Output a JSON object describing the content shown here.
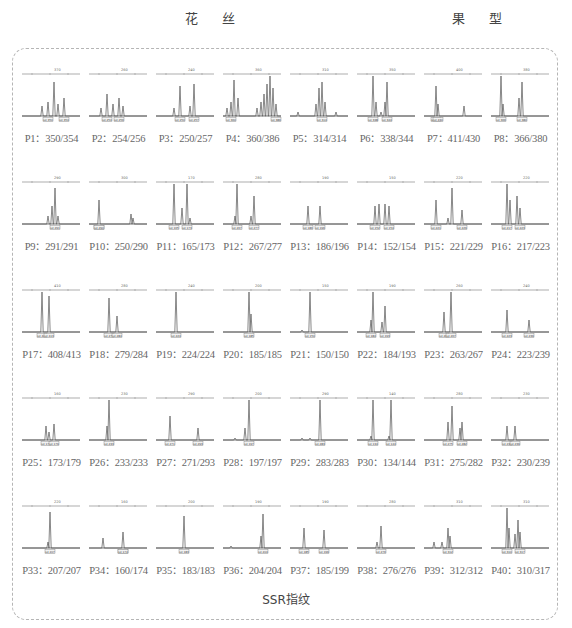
{
  "header": {
    "left_label": "花 丝",
    "right_label": "果 型"
  },
  "caption": "SSR指纹",
  "samples": [
    {
      "id": "P1",
      "label": "P1：350/354",
      "allele1": 350,
      "allele2": 354,
      "axis_tick": "370",
      "peaks": [
        [
          22,
          0.25
        ],
        [
          28,
          0.35
        ],
        [
          34,
          0.85
        ],
        [
          38,
          0.3
        ],
        [
          44,
          0.45
        ]
      ]
    },
    {
      "id": "P2",
      "label": "P2：254/256",
      "allele1": 254,
      "allele2": 256,
      "axis_tick": "260",
      "peaks": [
        [
          14,
          0.2
        ],
        [
          20,
          0.55
        ],
        [
          26,
          0.3
        ],
        [
          32,
          0.45
        ],
        [
          36,
          0.25
        ]
      ]
    },
    {
      "id": "P3",
      "label": "P3：250/257",
      "allele1": 250,
      "allele2": 257,
      "axis_tick": "240",
      "peaks": [
        [
          20,
          0.2
        ],
        [
          26,
          0.75
        ],
        [
          36,
          0.25
        ],
        [
          40,
          0.8
        ]
      ]
    },
    {
      "id": "P4",
      "label": "P4：360/386",
      "allele1": 360,
      "allele2": 386,
      "axis_tick": "360",
      "peaks": [
        [
          6,
          0.2
        ],
        [
          10,
          0.35
        ],
        [
          13,
          0.9
        ],
        [
          17,
          0.45
        ],
        [
          36,
          0.2
        ],
        [
          40,
          0.35
        ],
        [
          43,
          0.55
        ],
        [
          46,
          0.8
        ],
        [
          49,
          1.0
        ],
        [
          52,
          0.7
        ],
        [
          55,
          0.3
        ]
      ]
    },
    {
      "id": "P5",
      "label": "P5：314/314",
      "allele1": 314,
      "allele2": 314,
      "axis_tick": "310",
      "peaks": [
        [
          10,
          0.1
        ],
        [
          28,
          0.3
        ],
        [
          31,
          0.7
        ],
        [
          34,
          0.85
        ],
        [
          37,
          0.35
        ],
        [
          48,
          0.1
        ]
      ]
    },
    {
      "id": "P6",
      "label": "P6：338/344",
      "allele1": 338,
      "allele2": 344,
      "axis_tick": "350",
      "peaks": [
        [
          18,
          1.0
        ],
        [
          21,
          0.35
        ],
        [
          26,
          0.1
        ],
        [
          30,
          0.35
        ],
        [
          32,
          0.85
        ]
      ]
    },
    {
      "id": "P7",
      "label": "P7：411/430",
      "allele1": 411,
      "allele2": 430,
      "axis_tick": "400",
      "peaks": [
        [
          14,
          0.75
        ],
        [
          16,
          0.3
        ],
        [
          42,
          0.25
        ]
      ]
    },
    {
      "id": "P8",
      "label": "P8：366/380",
      "allele1": 366,
      "allele2": 380,
      "axis_tick": "380",
      "peaks": [
        [
          12,
          1.0
        ],
        [
          14,
          0.3
        ],
        [
          30,
          0.45
        ],
        [
          33,
          0.85
        ]
      ]
    },
    {
      "id": "P9",
      "label": "P9：291/291",
      "allele1": 291,
      "allele2": 291,
      "axis_tick": "290",
      "peaks": [
        [
          28,
          0.2
        ],
        [
          32,
          0.45
        ],
        [
          35,
          0.9
        ],
        [
          38,
          0.2
        ]
      ]
    },
    {
      "id": "P10",
      "label": "P10：250/290",
      "allele1": 250,
      "allele2": 290,
      "axis_tick": "300",
      "peaks": [
        [
          12,
          0.6
        ],
        [
          44,
          0.25
        ],
        [
          46,
          0.15
        ]
      ]
    },
    {
      "id": "P11",
      "label": "P11：165/173",
      "allele1": 165,
      "allele2": 173,
      "axis_tick": "170",
      "peaks": [
        [
          20,
          1.0
        ],
        [
          28,
          0.4
        ],
        [
          33,
          1.0
        ],
        [
          36,
          0.15
        ]
      ]
    },
    {
      "id": "P12",
      "label": "P12：267/277",
      "allele1": 267,
      "allele2": 277,
      "axis_tick": "280",
      "peaks": [
        [
          14,
          0.2
        ],
        [
          16,
          1.0
        ],
        [
          30,
          0.2
        ],
        [
          33,
          0.7
        ]
      ]
    },
    {
      "id": "P13",
      "label": "P13：186/196",
      "allele1": 186,
      "allele2": 196,
      "axis_tick": "190",
      "peaks": [
        [
          20,
          0.45
        ],
        [
          32,
          0.45
        ]
      ]
    },
    {
      "id": "P14",
      "label": "P14：152/154",
      "allele1": 152,
      "allele2": 154,
      "axis_tick": "150",
      "peaks": [
        [
          20,
          0.45
        ],
        [
          24,
          0.5
        ],
        [
          30,
          0.5
        ],
        [
          34,
          0.45
        ]
      ]
    },
    {
      "id": "P15",
      "label": "P15：221/229",
      "allele1": 221,
      "allele2": 229,
      "axis_tick": "220",
      "peaks": [
        [
          14,
          0.6
        ],
        [
          26,
          0.15
        ],
        [
          30,
          0.9
        ],
        [
          40,
          0.35
        ]
      ]
    },
    {
      "id": "P16",
      "label": "P16：217/223",
      "allele1": 217,
      "allele2": 223,
      "axis_tick": "220",
      "peaks": [
        [
          18,
          1.0
        ],
        [
          21,
          0.6
        ],
        [
          28,
          0.7
        ],
        [
          31,
          0.4
        ]
      ]
    },
    {
      "id": "P17",
      "label": "P17：408/413",
      "allele1": 408,
      "allele2": 413,
      "axis_tick": "410",
      "peaks": [
        [
          22,
          1.0
        ],
        [
          29,
          0.9
        ]
      ]
    },
    {
      "id": "P18",
      "label": "P18：279/284",
      "allele1": 279,
      "allele2": 284,
      "axis_tick": "280",
      "peaks": [
        [
          22,
          0.85
        ],
        [
          30,
          0.4
        ]
      ]
    },
    {
      "id": "P19",
      "label": "P19：224/224",
      "allele1": 224,
      "allele2": 224,
      "axis_tick": "240",
      "peaks": [
        [
          22,
          1.0
        ]
      ]
    },
    {
      "id": "P20",
      "label": "P20：185/185",
      "allele1": 185,
      "allele2": 185,
      "axis_tick": "200",
      "peaks": [
        [
          28,
          1.0
        ],
        [
          30,
          0.45
        ]
      ]
    },
    {
      "id": "P21",
      "label": "P21：150/150",
      "allele1": 150,
      "allele2": 150,
      "axis_tick": "150",
      "peaks": [
        [
          14,
          0.05
        ],
        [
          22,
          1.0
        ]
      ]
    },
    {
      "id": "P22",
      "label": "P22：184/193",
      "allele1": 184,
      "allele2": 193,
      "axis_tick": "190",
      "peaks": [
        [
          16,
          0.3
        ],
        [
          18,
          1.0
        ],
        [
          27,
          0.25
        ],
        [
          30,
          0.65
        ]
      ]
    },
    {
      "id": "P23",
      "label": "P23：263/267",
      "allele1": 263,
      "allele2": 267,
      "axis_tick": "260",
      "peaks": [
        [
          22,
          0.5
        ],
        [
          29,
          1.0
        ]
      ]
    },
    {
      "id": "P24",
      "label": "P24：223/239",
      "allele1": 223,
      "allele2": 239,
      "axis_tick": "240",
      "peaks": [
        [
          18,
          0.55
        ],
        [
          40,
          0.3
        ]
      ]
    },
    {
      "id": "P25",
      "label": "P25：173/179",
      "allele1": 173,
      "allele2": 179,
      "axis_tick": "160",
      "peaks": [
        [
          26,
          0.35
        ],
        [
          29,
          0.2
        ],
        [
          34,
          0.4
        ]
      ]
    },
    {
      "id": "P26",
      "label": "P26：233/233",
      "allele1": 233,
      "allele2": 233,
      "axis_tick": "230",
      "peaks": [
        [
          20,
          0.35
        ],
        [
          22,
          1.0
        ]
      ]
    },
    {
      "id": "P27",
      "label": "P27：271/293",
      "allele1": 271,
      "allele2": 293,
      "axis_tick": "290",
      "peaks": [
        [
          16,
          0.6
        ],
        [
          44,
          0.3
        ]
      ]
    },
    {
      "id": "P28",
      "label": "P28：197/197",
      "allele1": 197,
      "allele2": 197,
      "axis_tick": "200",
      "peaks": [
        [
          14,
          0.05
        ],
        [
          24,
          0.3
        ],
        [
          28,
          1.0
        ]
      ]
    },
    {
      "id": "P29",
      "label": "P29：283/283",
      "allele1": 283,
      "allele2": 283,
      "axis_tick": "290",
      "peaks": [
        [
          14,
          0.05
        ],
        [
          22,
          0.05
        ],
        [
          32,
          1.0
        ]
      ]
    },
    {
      "id": "P30",
      "label": "P30：134/144",
      "allele1": 134,
      "allele2": 144,
      "axis_tick": "140",
      "peaks": [
        [
          16,
          0.1
        ],
        [
          18,
          1.0
        ],
        [
          34,
          0.1
        ],
        [
          36,
          1.0
        ]
      ]
    },
    {
      "id": "P31",
      "label": "P31：275/282",
      "allele1": 275,
      "allele2": 282,
      "axis_tick": "280",
      "peaks": [
        [
          26,
          0.45
        ],
        [
          30,
          0.85
        ],
        [
          38,
          0.3
        ],
        [
          40,
          0.45
        ]
      ]
    },
    {
      "id": "P32",
      "label": "P32：230/239",
      "allele1": 230,
      "allele2": 239,
      "axis_tick": "230",
      "peaks": [
        [
          18,
          0.35
        ],
        [
          26,
          0.35
        ]
      ]
    },
    {
      "id": "P33",
      "label": "P33：207/207",
      "allele1": 207,
      "allele2": 207,
      "axis_tick": "220",
      "peaks": [
        [
          28,
          0.15
        ],
        [
          30,
          0.9
        ]
      ]
    },
    {
      "id": "P34",
      "label": "P34：160/174",
      "allele1": 160,
      "allele2": 174,
      "axis_tick": "160",
      "peaks": [
        [
          16,
          0.25
        ],
        [
          36,
          0.4
        ]
      ]
    },
    {
      "id": "P35",
      "label": "P35：183/183",
      "allele1": 183,
      "allele2": 183,
      "axis_tick": "200",
      "peaks": [
        [
          30,
          0.8
        ]
      ]
    },
    {
      "id": "P36",
      "label": "P36：204/204",
      "allele1": 204,
      "allele2": 204,
      "axis_tick": "190",
      "peaks": [
        [
          10,
          0.05
        ],
        [
          40,
          0.3
        ],
        [
          42,
          0.85
        ]
      ]
    },
    {
      "id": "P37",
      "label": "P37：185/199",
      "allele1": 185,
      "allele2": 199,
      "axis_tick": "190",
      "peaks": [
        [
          16,
          0.5
        ],
        [
          36,
          0.45
        ]
      ]
    },
    {
      "id": "P38",
      "label": "P38：276/276",
      "allele1": 276,
      "allele2": 276,
      "axis_tick": "280",
      "peaks": [
        [
          22,
          0.15
        ],
        [
          26,
          0.55
        ]
      ]
    },
    {
      "id": "P39",
      "label": "P39：312/312",
      "allele1": 312,
      "allele2": 312,
      "axis_tick": "310",
      "peaks": [
        [
          12,
          0.15
        ],
        [
          20,
          0.15
        ],
        [
          26,
          0.5
        ],
        [
          28,
          0.3
        ]
      ]
    },
    {
      "id": "P40",
      "label": "P40：310/317",
      "allele1": 310,
      "allele2": 317,
      "axis_tick": "310",
      "peaks": [
        [
          18,
          1.0
        ],
        [
          20,
          0.5
        ],
        [
          26,
          0.35
        ],
        [
          29,
          0.7
        ],
        [
          31,
          0.4
        ]
      ]
    }
  ]
}
